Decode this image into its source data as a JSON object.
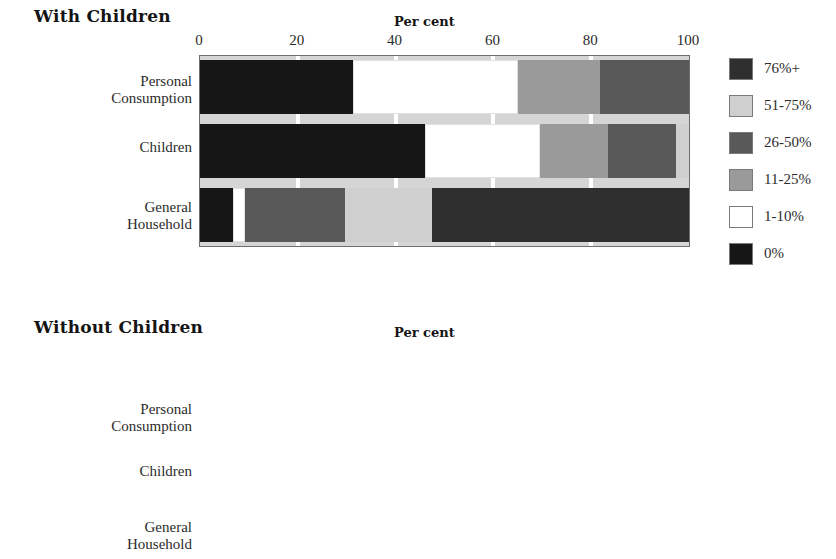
{
  "axis": {
    "title": "Per cent",
    "ticks": [
      0,
      20,
      40,
      60,
      80,
      100
    ],
    "tick_labels": [
      "0",
      "20",
      "40",
      "60",
      "80",
      "100"
    ]
  },
  "legend": {
    "items": [
      {
        "label": "76%+",
        "color": "#2f2f2f"
      },
      {
        "label": "51-75%",
        "color": "#cfcfcf"
      },
      {
        "label": "26-50%",
        "color": "#595959"
      },
      {
        "label": "11-25%",
        "color": "#9a9a9a"
      },
      {
        "label": "1-10%",
        "color": "#ffffff"
      },
      {
        "label": "0%",
        "color": "#161616"
      }
    ]
  },
  "panels": [
    {
      "id": "with-children",
      "title": "With Children",
      "categories": [
        "Personal\nConsumption",
        "Children",
        "General\nHousehold"
      ]
    },
    {
      "id": "without-children",
      "title": "Without Children",
      "categories": [
        "Personal\nConsumption",
        "Children",
        "General\nHousehold"
      ]
    }
  ],
  "chart_data": [
    {
      "type": "bar",
      "orientation": "horizontal",
      "stacked": true,
      "percent": true,
      "title": "With Children",
      "xlabel": "Per cent",
      "ylabel": "",
      "xlim": [
        0,
        100
      ],
      "xticks": [
        0,
        20,
        40,
        60,
        80,
        100
      ],
      "grid": false,
      "legend_position": "right",
      "categories": [
        "Personal Consumption",
        "Children",
        "General Household"
      ],
      "series": [
        {
          "name": "0%",
          "color": "#161616",
          "values": [
            31.3,
            46.0,
            6.8
          ]
        },
        {
          "name": "1-10%",
          "color": "#ffffff",
          "values": [
            33.7,
            23.5,
            2.4
          ]
        },
        {
          "name": "11-25%",
          "color": "#9a9a9a",
          "values": [
            16.8,
            14.0,
            0.0
          ]
        },
        {
          "name": "26-50%",
          "color": "#595959",
          "values": [
            18.2,
            13.9,
            20.5
          ]
        },
        {
          "name": "51-75%",
          "color": "#cfcfcf",
          "values": [
            0.0,
            2.6,
            17.7
          ]
        },
        {
          "name": "76%+",
          "color": "#2f2f2f",
          "values": [
            0.0,
            0.0,
            52.6
          ]
        }
      ]
    },
    {
      "type": "bar",
      "orientation": "horizontal",
      "stacked": true,
      "percent": true,
      "title": "Without Children",
      "xlabel": "Per cent",
      "ylabel": "",
      "xlim": [
        0,
        100
      ],
      "xticks": [
        0,
        20,
        40,
        60,
        80,
        100
      ],
      "grid": false,
      "legend_position": "right",
      "categories": [
        "Personal Consumption",
        "Children",
        "General Household"
      ],
      "series": [
        {
          "name": "0%",
          "color": "#161616",
          "values": [
            12.7,
            90.5,
            0.0
          ]
        },
        {
          "name": "1-10%",
          "color": "#ffffff",
          "values": [
            29.6,
            1.5,
            0.0
          ]
        },
        {
          "name": "11-25%",
          "color": "#9a9a9a",
          "values": [
            46.2,
            4.5,
            3.7
          ]
        },
        {
          "name": "26-50%",
          "color": "#595959",
          "values": [
            8.2,
            3.5,
            24.9
          ]
        },
        {
          "name": "51-75%",
          "color": "#cfcfcf",
          "values": [
            3.3,
            0.0,
            18.8
          ]
        },
        {
          "name": "76%+",
          "color": "#2f2f2f",
          "values": [
            0.0,
            0.0,
            52.6
          ]
        }
      ]
    }
  ]
}
